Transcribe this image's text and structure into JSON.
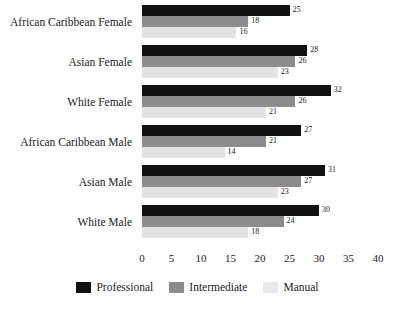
{
  "chart_data": {
    "type": "bar",
    "orientation": "horizontal",
    "title": "",
    "xlabel": "",
    "ylabel": "",
    "xlim": [
      0,
      40
    ],
    "xticks": [
      0,
      5,
      10,
      15,
      20,
      25,
      30,
      35,
      40
    ],
    "grid": false,
    "legend_position": "bottom",
    "categories": [
      "African Caribbean Female",
      "Asian Female",
      "White Female",
      "African Caribbean Male",
      "Asian Male",
      "White Male"
    ],
    "series": [
      {
        "name": "Professional",
        "color": "#111111",
        "values": [
          25,
          28,
          32,
          27,
          31,
          30
        ]
      },
      {
        "name": "Intermediate",
        "color": "#8c8c8c",
        "values": [
          18,
          26,
          26,
          21,
          27,
          24
        ]
      },
      {
        "name": "Manual",
        "color": "#e2e2e2",
        "values": [
          16,
          23,
          21,
          14,
          23,
          18
        ]
      }
    ]
  }
}
